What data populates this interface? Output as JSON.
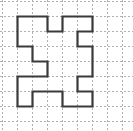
{
  "figure": {
    "canvas": {
      "width": 133,
      "height": 131,
      "background": "#ffffff"
    },
    "grid": {
      "cell_size": 15,
      "origin_x": 2,
      "origin_y": 1,
      "columns": 8,
      "rows": 8,
      "line_color": "#b0b0b0",
      "line_width": 1,
      "dash": "2,2",
      "visible": true
    },
    "shape": {
      "name": "z-block-polygon",
      "stroke_color": "#3a3a3a",
      "stroke_width": 2.2,
      "fill": "none",
      "closed": true,
      "units": "grid-cells",
      "vertices": [
        [
          1,
          1
        ],
        [
          3,
          1
        ],
        [
          3,
          2
        ],
        [
          4,
          2
        ],
        [
          4,
          1
        ],
        [
          6,
          1
        ],
        [
          6,
          2
        ],
        [
          5,
          2
        ],
        [
          5,
          3
        ],
        [
          6,
          3
        ],
        [
          6,
          5
        ],
        [
          5,
          5
        ],
        [
          5,
          6
        ],
        [
          6,
          6
        ],
        [
          6,
          7
        ],
        [
          4,
          7
        ],
        [
          4,
          6
        ],
        [
          2,
          6
        ],
        [
          2,
          7
        ],
        [
          1,
          7
        ],
        [
          1,
          5
        ],
        [
          3,
          5
        ],
        [
          3,
          4
        ],
        [
          2,
          4
        ],
        [
          2,
          3
        ],
        [
          1,
          3
        ]
      ]
    }
  }
}
